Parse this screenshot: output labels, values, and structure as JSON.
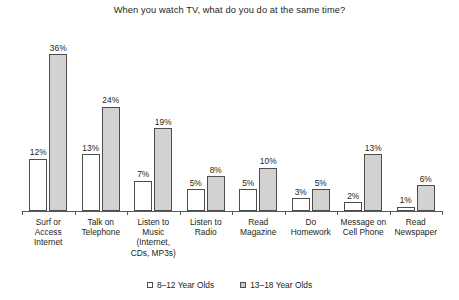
{
  "chart_data": {
    "type": "bar",
    "title": "When you watch TV, what do you do at the same time?",
    "xlabel": "",
    "ylabel": "",
    "ylim": [
      0,
      40
    ],
    "grid": false,
    "legend_position": "bottom",
    "value_suffix": "%",
    "categories": [
      "Surf or Access Internet",
      "Talk on Telephone",
      "Listen to Music (Internet, CDs, MP3s)",
      "Listen to Radio",
      "Read Magazine",
      "Do Homework",
      "Message on Cell Phone",
      "Read Newspaper"
    ],
    "category_lines": [
      [
        "Surf or",
        "Access",
        "Internet"
      ],
      [
        "Talk on",
        "Telephone"
      ],
      [
        "Listen to",
        "Music",
        "(Internet,",
        "CDs, MP3s)"
      ],
      [
        "Listen to",
        "Radio"
      ],
      [
        "Read",
        "Magazine"
      ],
      [
        "Do",
        "Homework"
      ],
      [
        "Message on",
        "Cell Phone"
      ],
      [
        "Read",
        "Newspaper"
      ]
    ],
    "series": [
      {
        "name": "8–12 Year Olds",
        "color": "#ffffff",
        "values": [
          12,
          13,
          7,
          5,
          5,
          3,
          2,
          1
        ],
        "labels": [
          "12%",
          "13%",
          "7%",
          "5%",
          "5%",
          "3%",
          "2%",
          "1%"
        ]
      },
      {
        "name": "13–18 Year Olds",
        "color": "#d2d2d2",
        "values": [
          36,
          24,
          19,
          8,
          10,
          5,
          13,
          6
        ],
        "labels": [
          "36%",
          "24%",
          "19%",
          "8%",
          "10%",
          "5%",
          "13%",
          "6%"
        ]
      }
    ]
  },
  "legend": {
    "items": [
      {
        "label": "8–12 Year Olds",
        "swatch": "legend-swatch-young"
      },
      {
        "label": "13–18 Year Olds",
        "swatch": "legend-swatch-teen"
      }
    ]
  }
}
